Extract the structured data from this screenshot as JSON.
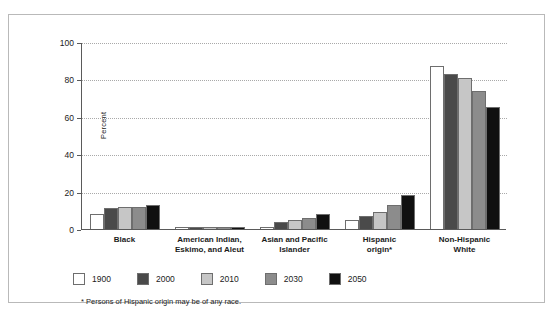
{
  "chart_data": {
    "type": "bar",
    "title": "",
    "xlabel": "",
    "ylabel": "Percent",
    "ylim": [
      0,
      100
    ],
    "yticks": [
      0,
      20,
      40,
      60,
      80,
      100
    ],
    "grid": true,
    "legend_position": "bottom-left",
    "categories": [
      "Black",
      "American Indian,\nEskimo, and Aleut",
      "Asian and Pacific\nIslander",
      "Hispanic\norigin*",
      "Non-Hispanic\nWhite"
    ],
    "category_lines": [
      [
        "Black"
      ],
      [
        "American Indian,",
        "Eskimo, and Aleut"
      ],
      [
        "Asian and Pacific",
        "Islander"
      ],
      [
        "Hispanic",
        "origin*"
      ],
      [
        "Non-Hispanic",
        "White"
      ]
    ],
    "series": [
      {
        "name": "1900",
        "color": "#ffffff",
        "values": [
          8,
          1,
          1,
          5,
          87
        ]
      },
      {
        "name": "2000",
        "color": "#4a4a4a",
        "values": [
          11,
          1,
          4,
          7,
          83
        ]
      },
      {
        "name": "2010",
        "color": "#c6c6c6",
        "values": [
          12,
          1,
          5,
          9,
          81
        ]
      },
      {
        "name": "2030",
        "color": "#8c8c8c",
        "values": [
          12,
          1,
          6,
          13,
          74
        ]
      },
      {
        "name": "2050",
        "color": "#101010",
        "values": [
          13,
          1,
          8,
          18,
          65
        ]
      }
    ],
    "annotations": {
      "footnote": "* Persons of Hispanic origin may be of any race."
    }
  },
  "legend": {
    "items": [
      {
        "label": "1900",
        "color": "#ffffff"
      },
      {
        "label": "2000",
        "color": "#4a4a4a"
      },
      {
        "label": "2010",
        "color": "#c6c6c6"
      },
      {
        "label": "2030",
        "color": "#8c8c8c"
      },
      {
        "label": "2050",
        "color": "#101010"
      }
    ]
  },
  "footnote": "* Persons of Hispanic origin may be of any race."
}
